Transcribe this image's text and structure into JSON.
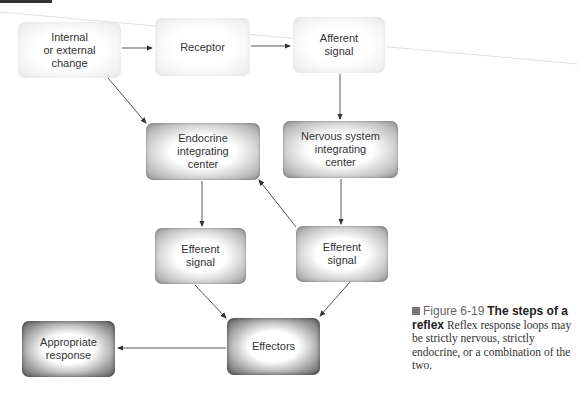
{
  "diagram": {
    "nodes": {
      "change": "Internal\nor external\nchange",
      "receptor": "Receptor",
      "afferent": "Afferent\nsignal",
      "endocrine": "Endocrine\nintegrating\ncenter",
      "nervous": "Nervous system\nintegrating\ncenter",
      "efferent_left": "Efferent\nsignal",
      "efferent_right": "Efferent\nsignal",
      "effectors": "Effectors",
      "response": "Appropriate\nresponse"
    },
    "edges": [
      [
        "change",
        "receptor"
      ],
      [
        "receptor",
        "afferent"
      ],
      [
        "change",
        "endocrine"
      ],
      [
        "afferent",
        "nervous"
      ],
      [
        "endocrine",
        "efferent_left"
      ],
      [
        "nervous",
        "efferent_right"
      ],
      [
        "efferent_right",
        "endocrine"
      ],
      [
        "efferent_left",
        "effectors"
      ],
      [
        "efferent_right",
        "effectors"
      ],
      [
        "effectors",
        "response"
      ]
    ]
  },
  "caption": {
    "figure_label": "Figure 6-19",
    "title": "The steps of a reflex",
    "body": "Reflex response loops may be strictly nervous, strictly endocrine, or a combination of the two."
  }
}
